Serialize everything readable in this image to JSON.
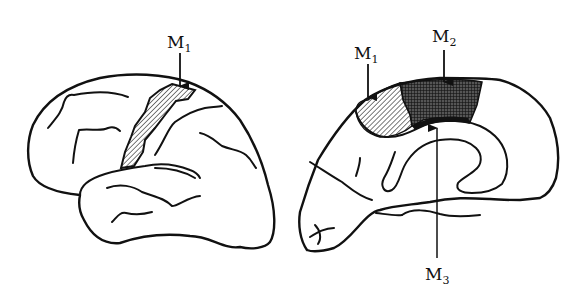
{
  "figure": {
    "type": "brain motor areas diagram",
    "colors": {
      "stroke": "#111111",
      "background": "#ffffff",
      "hatch": "#333333",
      "crosshatch": "#222222"
    }
  },
  "left_panel": {
    "view": "lateral",
    "labels": [
      {
        "id": "M1",
        "base": "M",
        "sub": "1",
        "pattern": "diagonal-hatch"
      }
    ]
  },
  "right_panel": {
    "view": "medial",
    "labels": [
      {
        "id": "M1",
        "base": "M",
        "sub": "1",
        "pattern": "diagonal-hatch"
      },
      {
        "id": "M2",
        "base": "M",
        "sub": "2",
        "pattern": "cross-hatch"
      },
      {
        "id": "M3",
        "base": "M",
        "sub": "3",
        "pattern": "solid"
      }
    ]
  }
}
